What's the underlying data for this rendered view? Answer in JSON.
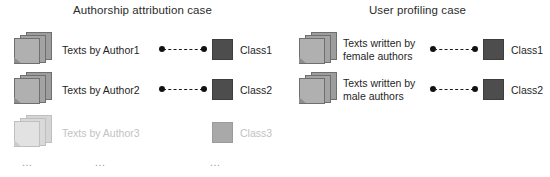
{
  "panels": [
    {
      "id": "authorship",
      "title": "Authorship attribution case",
      "rows": [
        {
          "icon": "document-stack-icon",
          "label": "Texts by Author1",
          "connector": true,
          "class_color": "#4d4d4d",
          "class_label": "Class1",
          "faded": false
        },
        {
          "icon": "document-stack-icon",
          "label": "Texts by Author2",
          "connector": true,
          "class_color": "#4d4d4d",
          "class_label": "Class2",
          "faded": false
        },
        {
          "icon": "document-stack-icon",
          "label": "Texts by Author3",
          "connector": false,
          "class_color": "#a9a9a9",
          "class_label": "Class3",
          "faded": true
        }
      ],
      "ellipsis": [
        "...",
        "...",
        "..."
      ]
    },
    {
      "id": "profiling",
      "title": "User profiling case",
      "rows": [
        {
          "icon": "document-stack-icon",
          "label": "Texts written by\nfemale authors",
          "connector": true,
          "class_color": "#4d4d4d",
          "class_label": "Class1",
          "faded": false
        },
        {
          "icon": "document-stack-icon",
          "label": "Texts written by\nmale authors",
          "connector": true,
          "class_color": "#4d4d4d",
          "class_label": "Class2",
          "faded": false
        }
      ],
      "ellipsis": []
    }
  ],
  "colors": {
    "background": "#ffffff",
    "text": "#1f1f1f",
    "faded_text": "#c2c2c2",
    "class_active": "#4d4d4d",
    "class_faded": "#a9a9a9",
    "connector": "#111111"
  }
}
